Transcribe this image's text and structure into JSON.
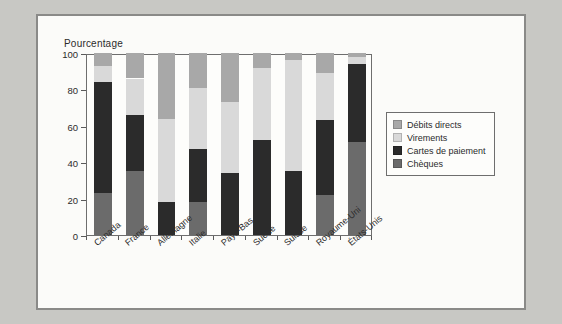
{
  "chart_data": {
    "type": "bar",
    "subtype": "stacked-bar-100",
    "title": "",
    "xlabel": "",
    "ylabel": "Pourcentage",
    "ylim": [
      0,
      100
    ],
    "yticks": [
      0,
      20,
      40,
      60,
      80,
      100
    ],
    "grid": false,
    "legend_position": "right",
    "categories": [
      "Canada",
      "France",
      "Allemagne",
      "Italie",
      "Pays-Bas",
      "Suède",
      "Suisse",
      "Royaume-Uni",
      "États-Unis"
    ],
    "series": [
      {
        "name": "Chèques",
        "color": "#6b6b6b",
        "values": [
          23,
          35,
          0,
          18,
          0,
          0,
          0,
          22,
          51
        ]
      },
      {
        "name": "Cartes de paiement",
        "color": "#2b2b2b",
        "values": [
          61,
          31,
          18,
          29,
          34,
          52,
          35,
          41,
          43
        ]
      },
      {
        "name": "Virements",
        "color": "#d9d9d9",
        "values": [
          9,
          20,
          46,
          34,
          39,
          40,
          61,
          26,
          4
        ]
      },
      {
        "name": "Débits directs",
        "color": "#a8a8a8",
        "values": [
          7,
          14,
          36,
          19,
          27,
          8,
          4,
          11,
          2
        ]
      }
    ],
    "cumulative_tops": {
      "Canada": [
        23,
        84,
        93,
        100
      ],
      "France": [
        35,
        66,
        86,
        100
      ],
      "Allemagne": [
        0,
        18,
        64,
        100
      ],
      "Italie": [
        18,
        47,
        81,
        100
      ],
      "Pays-Bas": [
        0,
        34,
        73,
        100
      ],
      "Suède": [
        0,
        52,
        92,
        100
      ],
      "Suisse": [
        0,
        35,
        96,
        100
      ],
      "Royaume-Uni": [
        22,
        63,
        89,
        100
      ],
      "États-Unis": [
        51,
        94,
        98,
        100
      ]
    }
  },
  "legend": {
    "items": [
      {
        "label": "Débits directs",
        "color": "#a8a8a8"
      },
      {
        "label": "Virements",
        "color": "#d9d9d9"
      },
      {
        "label": "Cartes de paiement",
        "color": "#2b2b2b"
      },
      {
        "label": "Chèques",
        "color": "#6b6b6b"
      }
    ]
  },
  "colors": {
    "page_background": "#c8c8c4",
    "figure_background": "#fbfbf9",
    "axis": "#6e6e6e",
    "text": "#2b2b2b"
  }
}
